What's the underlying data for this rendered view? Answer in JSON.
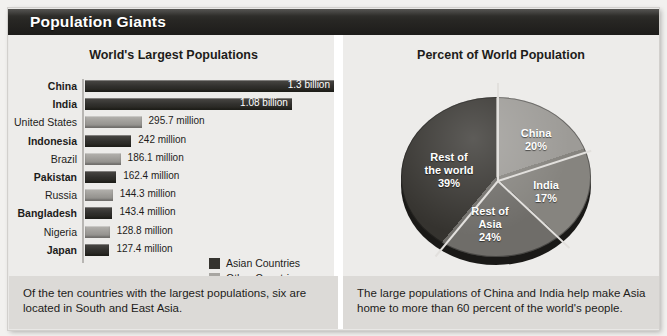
{
  "banner": {
    "title": "Population Giants"
  },
  "left_panel": {
    "title": "World's Largest Populations",
    "caption": "Of the ten countries with the largest populations, six are located in South and East Asia.",
    "legend": [
      {
        "label": "Asian Countries",
        "color": "#35332f"
      },
      {
        "label": "Other Countries",
        "color": "#a8a6a2"
      }
    ]
  },
  "right_panel": {
    "title": "Percent of World Population",
    "caption": "The large populations of China and India help make Asia home to more than 60 percent of the world's people."
  },
  "chart_data": [
    {
      "type": "bar",
      "title": "World's Largest Populations",
      "orientation": "horizontal",
      "xlabel": "",
      "ylabel": "",
      "grid": false,
      "legend_position": "inside-bottom-right",
      "categories": [
        "China",
        "India",
        "United States",
        "Indonesia",
        "Brazil",
        "Pakistan",
        "Russia",
        "Bangladesh",
        "Nigeria",
        "Japan"
      ],
      "values": [
        1300,
        1080,
        295.7,
        242,
        186.1,
        162.4,
        144.3,
        143.4,
        128.8,
        127.4
      ],
      "value_labels": [
        "1.3 billion",
        "1.08 billion",
        "295.7 million",
        "242 million",
        "186.1 million",
        "162.4 million",
        "143.4 million",
        "143.4 million",
        "128.8 million",
        "127.4 million"
      ],
      "groups": [
        "Asian Countries",
        "Asian Countries",
        "Other Countries",
        "Asian Countries",
        "Other Countries",
        "Asian Countries",
        "Other Countries",
        "Asian Countries",
        "Other Countries",
        "Asian Countries"
      ],
      "xlim": [
        0,
        1300
      ],
      "bars": [
        {
          "name": "China",
          "label": "China",
          "value_label": "1.3 billion",
          "group": "asian",
          "width_pct": 100.0,
          "inside": true
        },
        {
          "name": "India",
          "label": "India",
          "value_label": "1.08 billion",
          "group": "asian",
          "width_pct": 83.1,
          "inside": true
        },
        {
          "name": "United States",
          "label": "United States",
          "value_label": "295.7 million",
          "group": "other",
          "width_pct": 22.7,
          "inside": false
        },
        {
          "name": "Indonesia",
          "label": "Indonesia",
          "value_label": "242 million",
          "group": "asian",
          "width_pct": 18.6,
          "inside": false
        },
        {
          "name": "Brazil",
          "label": "Brazil",
          "value_label": "186.1 million",
          "group": "other",
          "width_pct": 14.3,
          "inside": false
        },
        {
          "name": "Pakistan",
          "label": "Pakistan",
          "value_label": "162.4 million",
          "group": "asian",
          "width_pct": 12.5,
          "inside": false
        },
        {
          "name": "Russia",
          "label": "Russia",
          "value_label": "144.3 million",
          "group": "other",
          "width_pct": 11.1,
          "inside": false
        },
        {
          "name": "Bangladesh",
          "label": "Bangladesh",
          "value_label": "143.4 million",
          "group": "asian",
          "width_pct": 11.0,
          "inside": false
        },
        {
          "name": "Nigeria",
          "label": "Nigeria",
          "value_label": "128.8 million",
          "group": "other",
          "width_pct": 9.9,
          "inside": false
        },
        {
          "name": "Japan",
          "label": "Japan",
          "value_label": "127.4 million",
          "group": "asian",
          "width_pct": 9.8,
          "inside": false
        }
      ]
    },
    {
      "type": "pie",
      "title": "Percent of World Population",
      "labels": [
        "China",
        "India",
        "Rest of Asia",
        "Rest of the world"
      ],
      "values": [
        20,
        17,
        24,
        39
      ],
      "value_labels": [
        "20%",
        "17%",
        "24%",
        "39%"
      ],
      "colors": [
        "#9d9b97",
        "#86847f",
        "#6f6d69",
        "#35332f"
      ],
      "slices": [
        {
          "name": "china",
          "line1": "China",
          "line2": "",
          "pct": "20%",
          "value": 20,
          "color": "#9d9b97"
        },
        {
          "name": "india",
          "line1": "India",
          "line2": "",
          "pct": "17%",
          "value": 17,
          "color": "#86847f"
        },
        {
          "name": "rest-of-asia",
          "line1": "Rest of",
          "line2": "Asia",
          "pct": "24%",
          "value": 24,
          "color": "#6f6d69"
        },
        {
          "name": "rest-of-world",
          "line1": "Rest of",
          "line2": "the world",
          "pct": "39%",
          "value": 39,
          "color": "#35332f"
        }
      ]
    }
  ]
}
